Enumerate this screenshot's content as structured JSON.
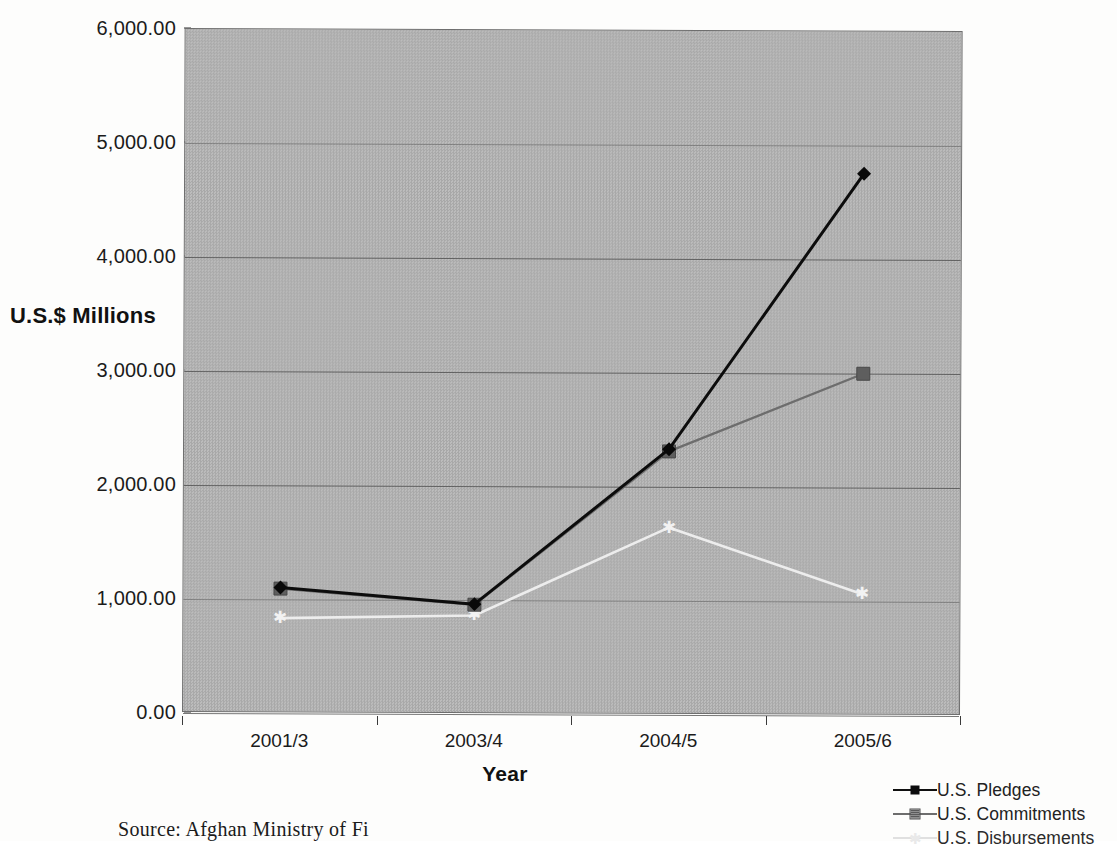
{
  "chart_data": {
    "type": "line",
    "title": "",
    "xlabel": "Year",
    "ylabel": "U.S.$ Millions",
    "categories": [
      "2001/3",
      "2003/4",
      "2004/5",
      "2005/6"
    ],
    "ylim": [
      0,
      6000
    ],
    "ytick_step": 1000,
    "ytick_labels": [
      "6,000.00",
      "5,000.00",
      "4,000.00",
      "3,000.00",
      "2,000.00",
      "1,000.00",
      "0.00"
    ],
    "ytick_values": [
      6000,
      5000,
      4000,
      3000,
      2000,
      1000,
      0
    ],
    "grid": true,
    "legend_position": "bottom-right",
    "series": [
      {
        "name": "U.S. Pledges",
        "marker": "diamond",
        "color": "#0c0c0c",
        "values": [
          1090,
          950,
          2320,
          4750
        ]
      },
      {
        "name": "U.S. Commitments",
        "marker": "square",
        "color": "#6d6d6d",
        "values": [
          1080,
          945,
          2300,
          2990
        ]
      },
      {
        "name": "U.S. Disbursements",
        "marker": "star",
        "color": "#ededed",
        "values": [
          820,
          850,
          1630,
          1050
        ]
      }
    ]
  },
  "axes": {
    "y_label": "U.S.$ Millions",
    "x_label": "Year"
  },
  "legend": {
    "items": [
      {
        "label": "U.S. Pledges"
      },
      {
        "label": "U.S. Commitments"
      },
      {
        "label": "U.S. Disbursements"
      }
    ]
  },
  "footnote": {
    "source": "Source: Afghan Ministry of Fi"
  }
}
